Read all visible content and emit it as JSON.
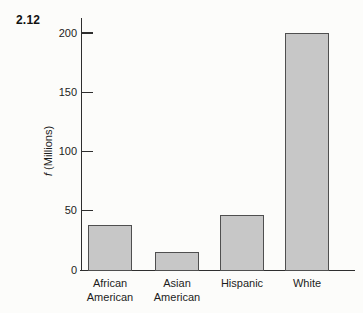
{
  "figure_label": "2.12",
  "ylabel_f": "f",
  "ylabel_units": " (Millions)",
  "chart_data": {
    "type": "bar",
    "title": "",
    "xlabel": "",
    "ylabel": "f (Millions)",
    "categories": [
      "African American",
      "Asian American",
      "Hispanic",
      "White"
    ],
    "values": [
      38,
      15,
      46,
      200
    ],
    "category_label_lines": [
      [
        "African",
        "American"
      ],
      [
        "Asian",
        "American"
      ],
      [
        "Hispanic"
      ],
      [
        "White"
      ]
    ],
    "ylim": [
      0,
      200
    ],
    "yticks": [
      200,
      150,
      100,
      50,
      0
    ],
    "grid": false,
    "legend": "none",
    "bar_fill": "#c7c7c7",
    "bar_border": "#4f4f4f"
  }
}
